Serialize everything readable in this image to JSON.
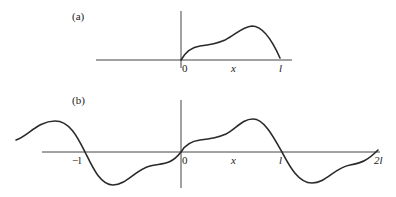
{
  "panels": [
    {
      "id": "a",
      "label": "(a)",
      "ticks": {
        "origin": "0",
        "mid": "x",
        "end": "l"
      },
      "description": "Function defined on interval [0, l]"
    },
    {
      "id": "b",
      "label": "(b)",
      "ticks": {
        "neg": "−l",
        "origin": "0",
        "mid": "x",
        "pos": "l",
        "end": "2l"
      },
      "description": "Odd periodic extension of the function with period 2l"
    }
  ],
  "colors": {
    "curve": "#2a2a2a",
    "axis": "#444444"
  }
}
